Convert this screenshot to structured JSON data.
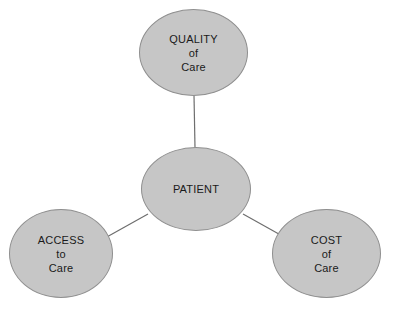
{
  "diagram": {
    "type": "hub-and-spoke",
    "background_color": "#ffffff",
    "node_fill_color": "#c6c6c6",
    "node_border_color": "#8f8f8f",
    "edge_color": "#6e6e6e",
    "text_color": "#1a1a1a",
    "center_node": {
      "id": "patient",
      "label": "PATIENT"
    },
    "satellite_nodes": [
      {
        "id": "quality",
        "label": "QUALITY\nof\nCare",
        "position": "top"
      },
      {
        "id": "access",
        "label": "ACCESS\nto\nCare",
        "position": "bottom-left"
      },
      {
        "id": "cost",
        "label": "COST\nof\nCare",
        "position": "bottom-right"
      }
    ],
    "edges": [
      {
        "from": "patient",
        "to": "quality"
      },
      {
        "from": "patient",
        "to": "access"
      },
      {
        "from": "patient",
        "to": "cost"
      }
    ]
  }
}
